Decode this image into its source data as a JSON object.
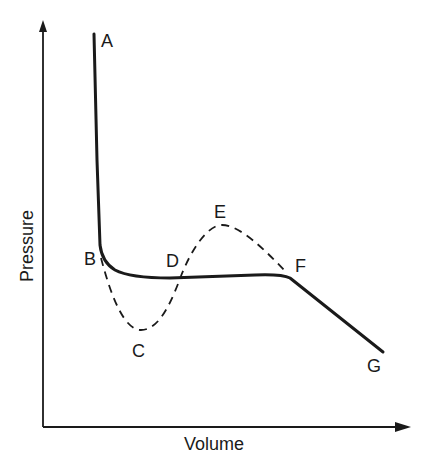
{
  "diagram": {
    "type": "pressure-volume isotherm",
    "axes": {
      "x_label": "Volume",
      "y_label": "Pressure"
    },
    "points": [
      {
        "id": "A",
        "label": "A"
      },
      {
        "id": "B",
        "label": "B"
      },
      {
        "id": "C",
        "label": "C"
      },
      {
        "id": "D",
        "label": "D"
      },
      {
        "id": "E",
        "label": "E"
      },
      {
        "id": "F",
        "label": "F"
      },
      {
        "id": "G",
        "label": "G"
      }
    ],
    "curves": [
      {
        "name": "actual-isotherm",
        "style": "solid",
        "path": [
          "A",
          "B",
          "D",
          "F",
          "G"
        ]
      },
      {
        "name": "theoretical-van-der-waals-loop",
        "style": "dashed",
        "path": [
          "B",
          "C",
          "D",
          "E",
          "F"
        ]
      }
    ],
    "colors": {
      "line": "#1a1a1a",
      "background": "#ffffff"
    }
  }
}
